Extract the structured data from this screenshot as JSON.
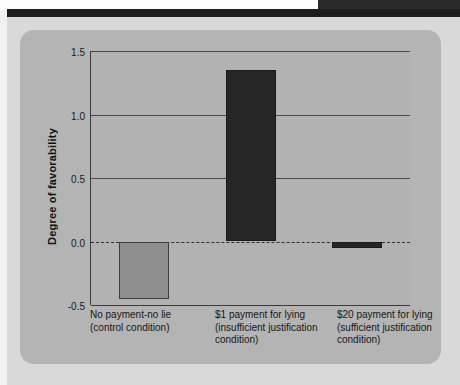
{
  "page": {
    "header_band_color": "#1d1d1d",
    "panel_background": "#b4b4b4",
    "page_background": "#d9d9d9"
  },
  "chart_data": {
    "type": "bar",
    "title": "",
    "subtitle": "",
    "xlabel": "",
    "ylabel": "Degree of favorability",
    "ylim": [
      -0.5,
      1.5
    ],
    "yticks": [
      "1.5",
      "1.0",
      "0.5",
      "0.0",
      "-0.5"
    ],
    "ytick_values": [
      1.5,
      1.0,
      0.5,
      0.0,
      -0.5
    ],
    "grid": true,
    "zero_line": "dashed",
    "legend": "none",
    "categories": [
      "No payment-no lie (control condition)",
      "$1 payment for lying (insufficient justification condition)",
      "$20 payment for lying (sufficient justification condition)"
    ],
    "category_lines": [
      [
        "No payment-no lie",
        "(control condition)"
      ],
      [
        "$1 payment for lying",
        "(insufficient justification",
        "condition)"
      ],
      [
        "$20 payment for lying",
        "(sufficient justification",
        "condition)"
      ]
    ],
    "values": [
      -0.45,
      1.35,
      -0.05
    ],
    "bar_colors": [
      "#8e8e8e",
      "#262626",
      "#262626"
    ],
    "bar_styles": [
      "light",
      "dark",
      "dark"
    ]
  }
}
